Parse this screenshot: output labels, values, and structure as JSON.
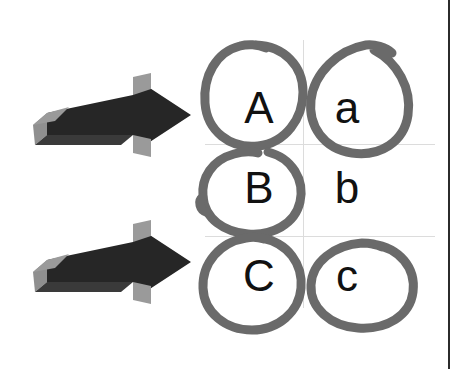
{
  "canvas": {
    "width": 459,
    "height": 369,
    "background_color": "#ffffff",
    "border_color": "#2b2b2b",
    "grid_color": "#dcdcdc"
  },
  "colors": {
    "arrow_body": "#262626",
    "arrow_bevel": "#8f8f8f",
    "arrow_bevel_dark": "#5a5a5a",
    "circle_stroke": "#6a6a6a",
    "letter_color": "#111111"
  },
  "arrows": [
    {
      "id": "arrow-top",
      "label": "right-arrow",
      "direction": "right",
      "x": 33,
      "y": 73,
      "width": 160,
      "height": 84
    },
    {
      "id": "arrow-bottom",
      "label": "right-arrow",
      "direction": "right",
      "x": 33,
      "y": 220,
      "width": 160,
      "height": 84
    }
  ],
  "grid": {
    "vertical_lines": [
      303
    ],
    "horizontal_lines": [
      144,
      236
    ]
  },
  "letters": [
    {
      "id": "cell-A",
      "text": "A",
      "case": "uppercase",
      "circled": true,
      "x": 215,
      "y": 72,
      "w": 88,
      "h": 72
    },
    {
      "id": "cell-a",
      "text": "a",
      "case": "lowercase",
      "circled": true,
      "x": 303,
      "y": 72,
      "w": 88,
      "h": 72
    },
    {
      "id": "cell-B",
      "text": "B",
      "case": "uppercase",
      "circled": true,
      "x": 215,
      "y": 144,
      "w": 88,
      "h": 92
    },
    {
      "id": "cell-b",
      "text": "b",
      "case": "lowercase",
      "circled": false,
      "x": 303,
      "y": 144,
      "w": 88,
      "h": 92
    },
    {
      "id": "cell-C",
      "text": "C",
      "case": "uppercase",
      "circled": true,
      "x": 215,
      "y": 236,
      "w": 88,
      "h": 76
    },
    {
      "id": "cell-c",
      "text": "c",
      "case": "lowercase",
      "circled": true,
      "x": 303,
      "y": 236,
      "w": 88,
      "h": 76
    }
  ],
  "annotation_summary": {
    "circled_letters": "A, a, B, C, c",
    "uncircled_letters": "b",
    "circle_count": 5,
    "arrow_count": 2
  }
}
